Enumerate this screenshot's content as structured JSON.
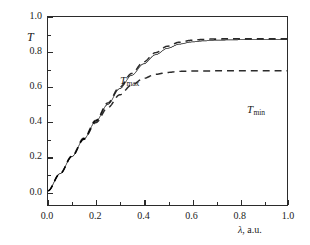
{
  "figure": {
    "background": "#ffffff",
    "ink_color": "#2b2b2b",
    "width": 310,
    "height": 245
  },
  "axes": {
    "y_title": "T",
    "x_title_symbol": "λ",
    "x_title_rest": ", a.u.",
    "x_title_full": "λ, a.u.",
    "x_ticks": [
      "0.0",
      "0.2",
      "0.4",
      "0.6",
      "0.8",
      "1.0"
    ],
    "y_ticks": [
      "0.0",
      "0.2",
      "0.4",
      "0.6",
      "0.8",
      "1.0"
    ],
    "x_tick_values": [
      0.0,
      0.2,
      0.4,
      0.6,
      0.8,
      1.0
    ],
    "y_tick_values": [
      0.0,
      0.2,
      0.4,
      0.6,
      0.8,
      1.0
    ],
    "x_minor_values": [
      0.1,
      0.3,
      0.5,
      0.7,
      0.9
    ],
    "y_minor_values": [
      0.1,
      0.3,
      0.5,
      0.7,
      0.9
    ],
    "tick_direction": "in"
  },
  "annotations": {
    "tmax": {
      "base": "T",
      "sub": "max"
    },
    "tmin": {
      "base": "T",
      "sub": "min"
    }
  },
  "chart_data": {
    "type": "line",
    "title": "",
    "subtitle": "",
    "xlabel": "λ, a.u.",
    "ylabel": "T",
    "xlim": [
      0.0,
      1.0
    ],
    "ylim": [
      -0.082,
      1.0
    ],
    "grid": false,
    "legend": "none",
    "annotations": [
      {
        "text": "T_max",
        "x": 0.115,
        "y": 0.795,
        "note": "label for upper dashed envelope"
      },
      {
        "text": "T_min",
        "x": 0.645,
        "y": 0.645,
        "note": "label for lower dashed envelope"
      }
    ],
    "series": [
      {
        "name": "T",
        "style": "solid",
        "color": "#2b2b2b",
        "width": 1.0,
        "description": "Fabry-Perot style transmission fringes; oscillation period grows with lambda, amplitude grows from 0 and settles between the two envelopes",
        "model": {
          "kind": "oscillating_envelope",
          "envelope_max_expr": "Tmax(x)",
          "envelope_min_expr": "Tmin(x)",
          "phase_expr": "phi(x) = 2*pi*k/x, k = 0.0455",
          "comment": "T(x) = Tmin(x) + (Tmax(x)-Tmin(x)) * (0.5 + 0.5*cos(phi(x)))"
        }
      },
      {
        "name": "T_max",
        "style": "dashed",
        "color": "#2b2b2b",
        "width": 1.4,
        "dash": "7,5",
        "description": "upper envelope, saturating asymptote",
        "asymptote": 0.875,
        "points": [
          [
            0.0,
            0.0
          ],
          [
            0.05,
            0.098
          ],
          [
            0.1,
            0.2
          ],
          [
            0.15,
            0.303
          ],
          [
            0.2,
            0.405
          ],
          [
            0.25,
            0.505
          ],
          [
            0.3,
            0.597
          ],
          [
            0.35,
            0.675
          ],
          [
            0.4,
            0.742
          ],
          [
            0.45,
            0.795
          ],
          [
            0.5,
            0.832
          ],
          [
            0.55,
            0.855
          ],
          [
            0.6,
            0.866
          ],
          [
            0.65,
            0.871
          ],
          [
            0.7,
            0.874
          ],
          [
            0.8,
            0.875
          ],
          [
            0.9,
            0.875
          ],
          [
            1.0,
            0.875
          ]
        ]
      },
      {
        "name": "T_min",
        "style": "dashed",
        "color": "#2b2b2b",
        "width": 1.4,
        "dash": "7,5",
        "description": "lower envelope, saturating asymptote",
        "asymptote": 0.69,
        "points": [
          [
            0.0,
            0.0
          ],
          [
            0.05,
            0.097
          ],
          [
            0.1,
            0.197
          ],
          [
            0.15,
            0.296
          ],
          [
            0.2,
            0.392
          ],
          [
            0.25,
            0.478
          ],
          [
            0.3,
            0.552
          ],
          [
            0.35,
            0.608
          ],
          [
            0.4,
            0.647
          ],
          [
            0.45,
            0.67
          ],
          [
            0.5,
            0.681
          ],
          [
            0.55,
            0.687
          ],
          [
            0.6,
            0.689
          ],
          [
            0.7,
            0.69
          ],
          [
            0.8,
            0.69
          ],
          [
            0.9,
            0.69
          ],
          [
            1.0,
            0.69
          ]
        ]
      }
    ],
    "fringe_extrema": {
      "maxima_x": [
        0.355,
        0.41,
        0.485,
        0.585,
        0.78
      ],
      "maxima_y": [
        0.69,
        0.74,
        0.8,
        0.865,
        0.875
      ],
      "minima_x": [
        0.38,
        0.44,
        0.525,
        0.665,
        0.98
      ],
      "minima_y": [
        0.6,
        0.645,
        0.672,
        0.69,
        0.7
      ]
    }
  }
}
